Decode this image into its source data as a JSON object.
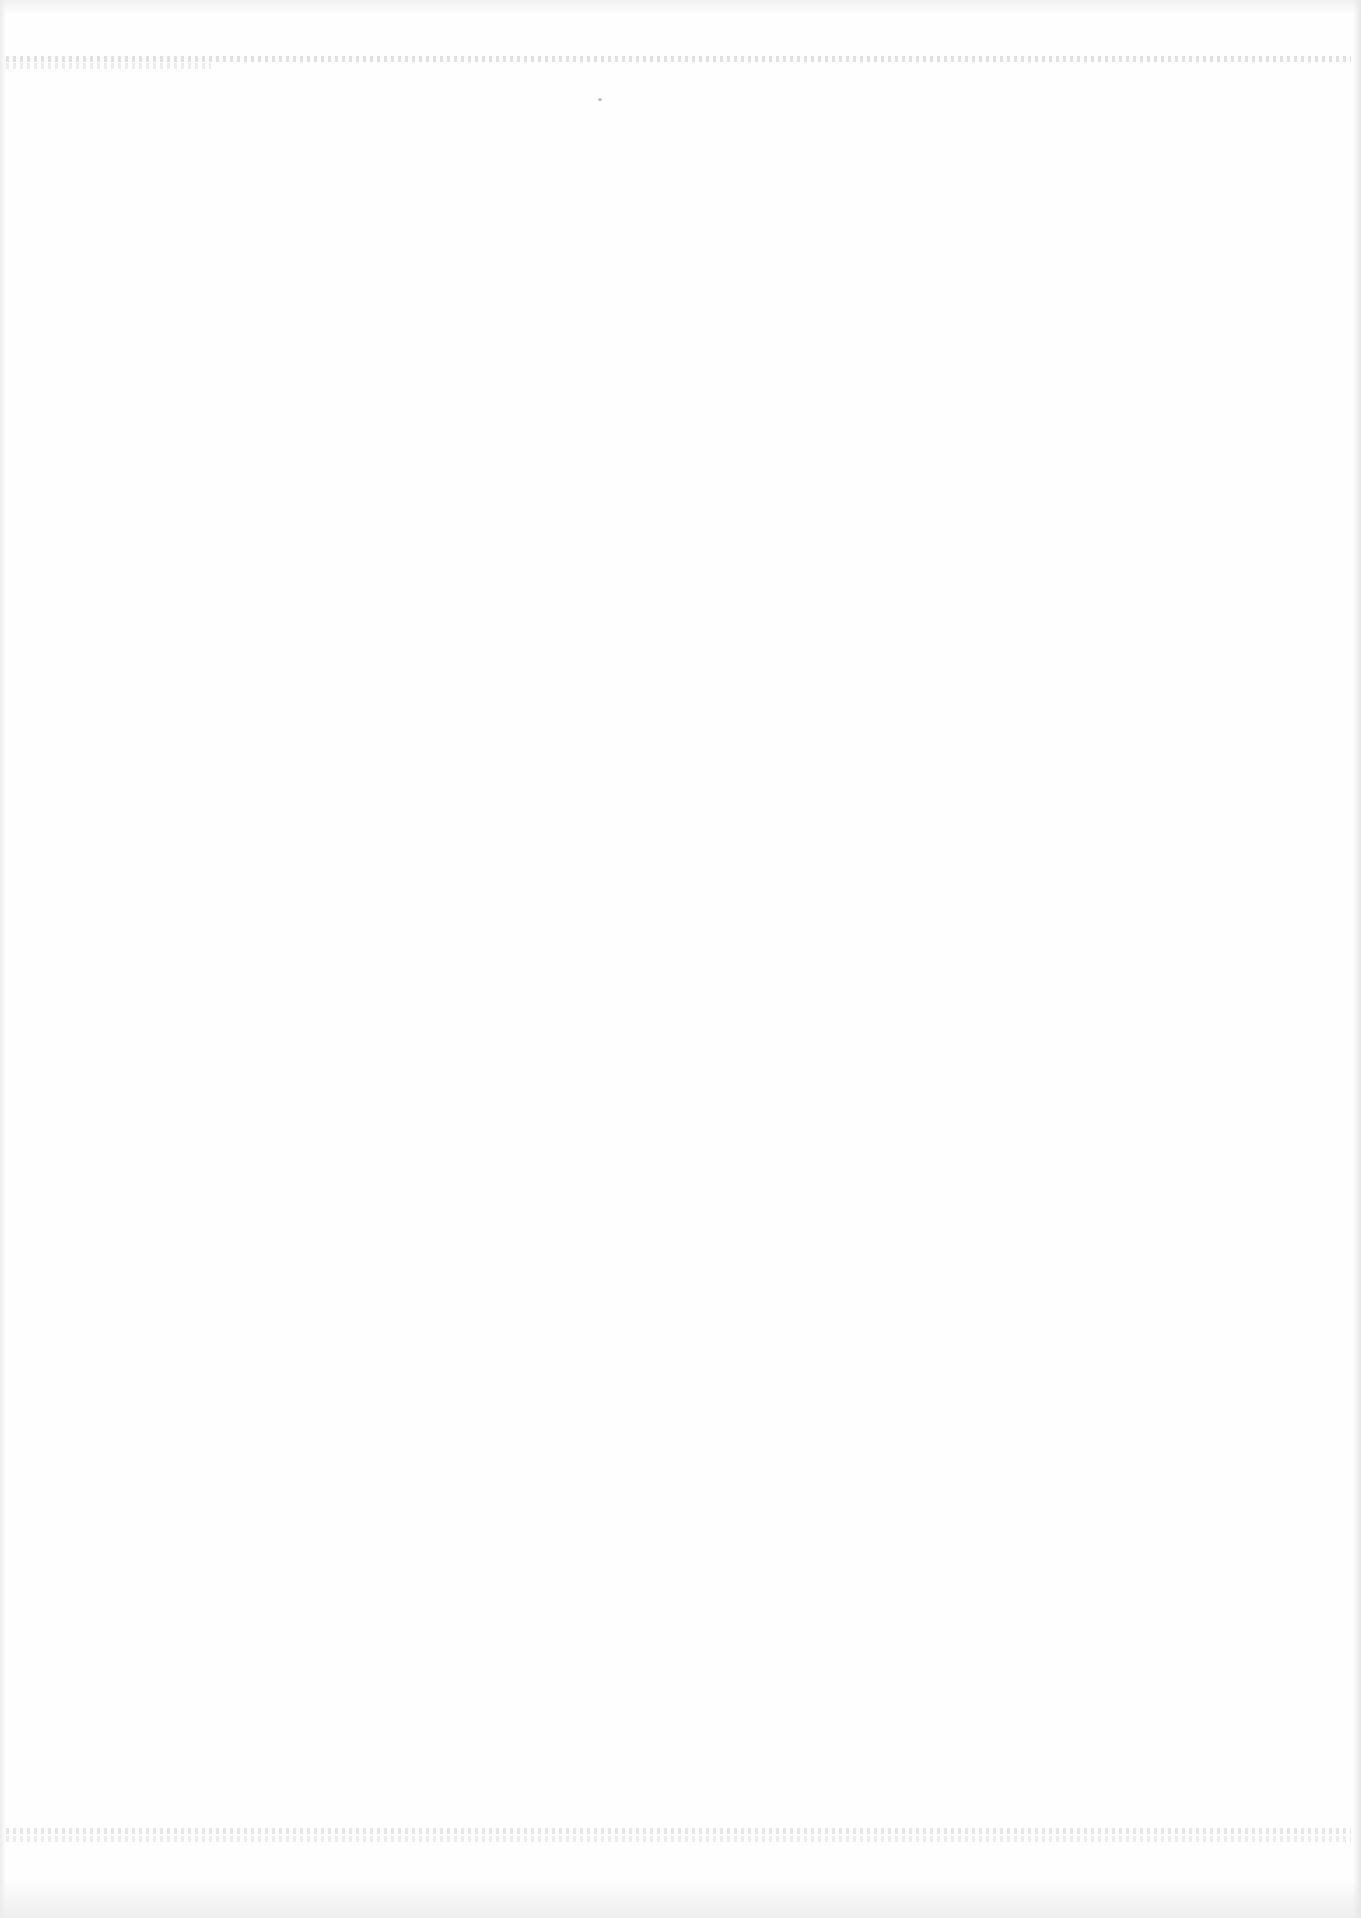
{
  "document": {
    "type": "scanned-page",
    "content": "",
    "legible_text": []
  }
}
